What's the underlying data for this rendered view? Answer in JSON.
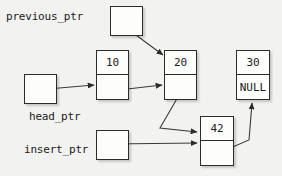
{
  "diagram": {
    "type": "pointer-diagram",
    "background_color": "#f2f2f0",
    "line_color": "#3a3a3a",
    "box_border_color": "#2b2b2b",
    "box_fill_color": "#fdfdfc",
    "text_color": "#1b1b1b"
  },
  "pointers": [
    {
      "id": "previous_ptr",
      "label": "previous_ptr",
      "label_x": 6,
      "label_y": 10,
      "box_x": 110,
      "box_y": 6,
      "box_w": 33,
      "box_h": 30,
      "points_to": "node_20"
    },
    {
      "id": "head_ptr",
      "label": "head_ptr",
      "label_x": 29,
      "label_y": 110,
      "box_x": 24,
      "box_y": 74,
      "box_w": 33,
      "box_h": 30,
      "points_to": "node_10"
    },
    {
      "id": "insert_ptr",
      "label": "insert_ptr",
      "label_x": 24,
      "label_y": 143,
      "box_x": 96,
      "box_y": 130,
      "box_w": 33,
      "box_h": 30,
      "points_to": "node_42"
    }
  ],
  "nodes": [
    {
      "id": "node_10",
      "value": "10",
      "pointer_text": "",
      "x": 96,
      "y": 50,
      "w": 33,
      "h": 50
    },
    {
      "id": "node_20",
      "value": "20",
      "pointer_text": "",
      "x": 164,
      "y": 50,
      "w": 33,
      "h": 50
    },
    {
      "id": "node_30",
      "value": "30",
      "pointer_text": "NULL",
      "x": 236,
      "y": 50,
      "w": 34,
      "h": 50
    },
    {
      "id": "node_42",
      "value": "42",
      "pointer_text": "",
      "x": 200,
      "y": 116,
      "w": 34,
      "h": 50
    }
  ],
  "arrows": [
    {
      "id": "arrow-previous-ptr-to-20",
      "from": "previous_ptr",
      "to": "node_20",
      "path": "M 117,21 L 163,55"
    },
    {
      "id": "arrow-head-ptr-to-10",
      "from": "head_ptr",
      "to": "node_10",
      "path": "M 36,90 L 94,85"
    },
    {
      "id": "arrow-node-10-to-20",
      "from": "node_10",
      "to": "node_20",
      "path": "M 110,91 L 162,85"
    },
    {
      "id": "arrow-node-20-to-42",
      "from": "node_20",
      "to": "node_42",
      "path": "M 182,90 L 160,128 L 197,132"
    },
    {
      "id": "arrow-insert-ptr-to-42",
      "from": "insert_ptr",
      "to": "node_42",
      "path": "M 110,144 L 197,143"
    },
    {
      "id": "arrow-node-42-to-30",
      "from": "node_42",
      "to": "node_30",
      "path": "M 212,156 L 249,140 L 252,103"
    }
  ]
}
